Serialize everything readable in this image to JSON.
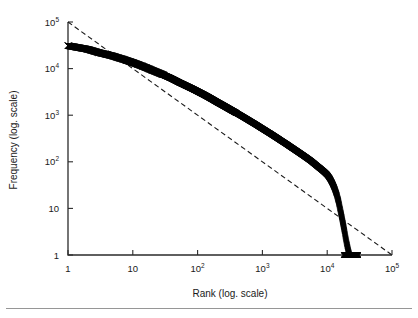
{
  "figure": {
    "background_color": "#ffffff",
    "foreground_color": "#1a1a1a",
    "bottom_rule_color": "#8a8a8a"
  },
  "axes": {
    "x_title": "Rank (log. scale)",
    "y_title": "Frequency (log. scale)",
    "x_ticks": [
      {
        "base": "1",
        "exp": ""
      },
      {
        "base": "10",
        "exp": ""
      },
      {
        "base": "10",
        "exp": "2"
      },
      {
        "base": "10",
        "exp": "3"
      },
      {
        "base": "10",
        "exp": "4"
      },
      {
        "base": "10",
        "exp": "5"
      }
    ],
    "y_ticks": [
      {
        "base": "1",
        "exp": ""
      },
      {
        "base": "10",
        "exp": ""
      },
      {
        "base": "10",
        "exp": "2"
      },
      {
        "base": "10",
        "exp": "3"
      },
      {
        "base": "10",
        "exp": "4"
      },
      {
        "base": "10",
        "exp": "5"
      }
    ]
  },
  "chart_data": {
    "type": "scatter",
    "title": "",
    "xlabel": "Rank (log. scale)",
    "ylabel": "Frequency (log. scale)",
    "xscale": "log",
    "yscale": "log",
    "xlim": [
      1,
      100000
    ],
    "ylim": [
      1,
      100000
    ],
    "grid": false,
    "legend": "none",
    "marker": "x",
    "marker_color": "#000000",
    "series": [
      {
        "name": "Rank-frequency distribution",
        "marker": "x",
        "points": [
          [
            1,
            31000
          ],
          [
            2,
            26000
          ],
          [
            3,
            22000
          ],
          [
            4,
            20000
          ],
          [
            5,
            18500
          ],
          [
            6,
            17000
          ],
          [
            7,
            16000
          ],
          [
            8,
            15000
          ],
          [
            9,
            14200
          ],
          [
            10,
            13500
          ],
          [
            12,
            12300
          ],
          [
            14,
            11300
          ],
          [
            16,
            10500
          ],
          [
            18,
            9800
          ],
          [
            20,
            9200
          ],
          [
            24,
            8300
          ],
          [
            28,
            7600
          ],
          [
            32,
            7000
          ],
          [
            38,
            6300
          ],
          [
            45,
            5600
          ],
          [
            52,
            5050
          ],
          [
            60,
            4600
          ],
          [
            70,
            4150
          ],
          [
            80,
            3800
          ],
          [
            90,
            3500
          ],
          [
            100,
            3250
          ],
          [
            120,
            2850
          ],
          [
            140,
            2540
          ],
          [
            170,
            2180
          ],
          [
            200,
            1910
          ],
          [
            240,
            1660
          ],
          [
            280,
            1470
          ],
          [
            330,
            1290
          ],
          [
            400,
            1110
          ],
          [
            470,
            975
          ],
          [
            560,
            845
          ],
          [
            660,
            735
          ],
          [
            780,
            640
          ],
          [
            900,
            565
          ],
          [
            1000,
            515
          ],
          [
            1200,
            440
          ],
          [
            1400,
            385
          ],
          [
            1700,
            323
          ],
          [
            2000,
            278
          ],
          [
            2400,
            236
          ],
          [
            2800,
            204
          ],
          [
            3300,
            175
          ],
          [
            4000,
            146
          ],
          [
            4700,
            125
          ],
          [
            5600,
            105
          ],
          [
            6600,
            87
          ],
          [
            7800,
            72
          ],
          [
            9000,
            61
          ],
          [
            10000,
            53
          ],
          [
            11000,
            44
          ],
          [
            12000,
            35
          ],
          [
            13000,
            27
          ],
          [
            14000,
            20
          ],
          [
            15000,
            14
          ],
          [
            16000,
            9
          ],
          [
            17000,
            6
          ],
          [
            18000,
            4
          ],
          [
            19000,
            2.6
          ],
          [
            20000,
            1.8
          ],
          [
            21000,
            1.3
          ],
          [
            22000,
            1
          ],
          [
            24000,
            1
          ],
          [
            26000,
            1
          ],
          [
            28000,
            1
          ],
          [
            30000,
            1
          ]
        ]
      }
    ],
    "reference_line": {
      "name": "Zipf reference (slope -1)",
      "style": "dashed",
      "slope": -1,
      "start": [
        1,
        100000
      ],
      "end": [
        100000,
        1
      ]
    }
  }
}
